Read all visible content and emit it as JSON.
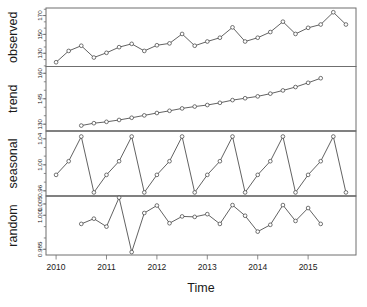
{
  "figure": {
    "title": "",
    "xlabel": "Time",
    "panel_labels": [
      "observed",
      "trend",
      "seasonal",
      "random"
    ]
  },
  "axis": {
    "x_ticks": [
      "2010",
      "2011",
      "2012",
      "2013",
      "2014",
      "2015"
    ],
    "x_tick_values": [
      2010,
      2011,
      2012,
      2013,
      2014,
      2015
    ],
    "observed_ticks": [
      "130",
      "150",
      "170"
    ],
    "trend_ticks": [
      "130",
      "145",
      "160"
    ],
    "seasonal_ticks": [
      "0.96",
      "1.00",
      "1.04"
    ],
    "random_ticks": [
      "0.985",
      "1.000",
      "1.005"
    ]
  },
  "chart_data": [
    {
      "type": "line",
      "title": "observed",
      "xlabel": "Time",
      "ylabel": "observed",
      "ylim": [
        116,
        178
      ],
      "xlim": [
        2009.8,
        2015.95
      ],
      "grid": false,
      "legend": null,
      "x": [
        2010.0,
        2010.25,
        2010.5,
        2010.75,
        2011.0,
        2011.25,
        2011.5,
        2011.75,
        2012.0,
        2012.25,
        2012.5,
        2012.75,
        2013.0,
        2013.25,
        2013.5,
        2013.75,
        2014.0,
        2014.25,
        2014.5,
        2014.75,
        2015.0,
        2015.25,
        2015.5,
        2015.75
      ],
      "values": [
        120.5,
        132.5,
        138.0,
        125.5,
        130.5,
        136.5,
        140.0,
        132.5,
        138.5,
        140.5,
        150.5,
        138.0,
        142.5,
        146.5,
        157.5,
        142.5,
        146.5,
        152.5,
        163.5,
        150.5,
        157.0,
        160.5,
        173.5,
        160.5
      ]
    },
    {
      "type": "line",
      "title": "trend",
      "xlabel": "Time",
      "ylabel": "trend",
      "ylim": [
        126,
        164
      ],
      "xlim": [
        2009.8,
        2015.95
      ],
      "grid": false,
      "legend": null,
      "x": [
        2010.5,
        2010.75,
        2011.0,
        2011.25,
        2011.5,
        2011.75,
        2012.0,
        2012.25,
        2012.5,
        2012.75,
        2013.0,
        2013.25,
        2013.5,
        2013.75,
        2014.0,
        2014.25,
        2014.5,
        2014.75,
        2015.0,
        2015.25
      ],
      "values": [
        129.2,
        130.6,
        131.4,
        132.5,
        133.8,
        135.2,
        136.6,
        137.9,
        139.3,
        140.4,
        141.3,
        142.6,
        144.2,
        145.3,
        146.4,
        148.0,
        149.9,
        151.9,
        154.4,
        157.1
      ]
    },
    {
      "type": "line",
      "title": "seasonal",
      "xlabel": "Time",
      "ylabel": "seasonal",
      "ylim": [
        0.952,
        1.052
      ],
      "xlim": [
        2009.8,
        2015.95
      ],
      "grid": false,
      "legend": null,
      "period": 4,
      "season_values": [
        0.9845,
        1.0055,
        1.0435,
        0.9575
      ],
      "x": [
        2010.0,
        2010.25,
        2010.5,
        2010.75,
        2011.0,
        2011.25,
        2011.5,
        2011.75,
        2012.0,
        2012.25,
        2012.5,
        2012.75,
        2013.0,
        2013.25,
        2013.5,
        2013.75,
        2014.0,
        2014.25,
        2014.5,
        2014.75,
        2015.0,
        2015.25,
        2015.5,
        2015.75
      ],
      "values": [
        0.9845,
        1.0055,
        1.0435,
        0.9575,
        0.9845,
        1.0055,
        1.0435,
        0.9575,
        0.9845,
        1.0055,
        1.0435,
        0.9575,
        0.9845,
        1.0055,
        1.0435,
        0.9575,
        0.9845,
        1.0055,
        1.0435,
        0.9575,
        0.9845,
        1.0055,
        1.0435,
        0.9575
      ]
    },
    {
      "type": "line",
      "title": "random",
      "xlabel": "Time",
      "ylabel": "random",
      "ylim": [
        0.9825,
        1.0085
      ],
      "xlim": [
        2009.8,
        2015.95
      ],
      "grid": false,
      "legend": null,
      "x": [
        2010.5,
        2010.75,
        2011.0,
        2011.25,
        2011.5,
        2011.75,
        2012.0,
        2012.25,
        2012.5,
        2012.75,
        2013.0,
        2013.25,
        2013.5,
        2013.75,
        2014.0,
        2014.25,
        2014.5,
        2014.75,
        2015.0,
        2015.25
      ],
      "values": [
        0.9962,
        0.9985,
        0.995,
        1.0078,
        0.9838,
        1.001,
        1.0043,
        0.9965,
        0.9995,
        0.9993,
        1.0005,
        0.9962,
        1.0045,
        0.9998,
        0.9928,
        0.9958,
        1.0045,
        0.9975,
        1.0032,
        0.9962
      ]
    }
  ]
}
